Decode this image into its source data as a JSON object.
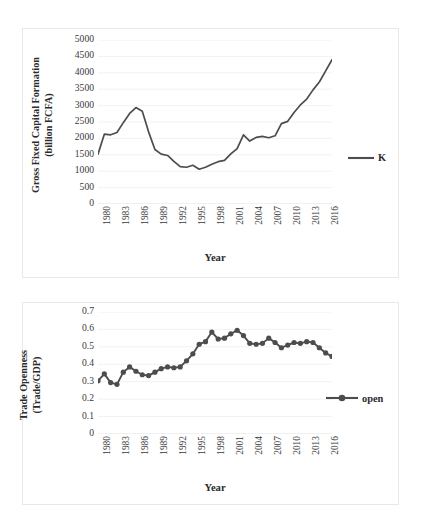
{
  "page": {
    "background": "#ffffff",
    "width": 421,
    "height": 524
  },
  "charts": [
    {
      "id": "chart1",
      "series_color": "#4d4d4d",
      "axis_title_y_line1": "Gross Fixed Capital Formation",
      "axis_title_y_line2": "(billion FCFA)",
      "axis_title_x": "Year",
      "legend_label": "K"
    },
    {
      "id": "chart2",
      "series_color": "#4d4d4d",
      "axis_title_y_line1": "Trade Openness",
      "axis_title_y_line2": "(Trade/GDP)",
      "axis_title_x": "Year",
      "legend_label": "open"
    }
  ],
  "chart_data": [
    {
      "type": "line",
      "title": "",
      "xlabel": "Year",
      "ylabel": "Gross Fixed Capital Formation (billion FCFA)",
      "legend": [
        "K"
      ],
      "legend_position": "right",
      "grid": true,
      "marker": "none",
      "xlim": [
        1980,
        2017
      ],
      "ylim": [
        0,
        5000
      ],
      "ytick_labels": [
        "5000",
        "4500",
        "4000",
        "3500",
        "3000",
        "2500",
        "2000",
        "1500",
        "1000",
        "500",
        "0"
      ],
      "ytick_values": [
        5000,
        4500,
        4000,
        3500,
        3000,
        2500,
        2000,
        1500,
        1000,
        500,
        0
      ],
      "xtick_labels": [
        "1980",
        "1983",
        "1986",
        "1989",
        "1992",
        "1995",
        "1998",
        "2001",
        "2004",
        "2007",
        "2010",
        "2013",
        "2016"
      ],
      "xtick_values": [
        1980,
        1983,
        1986,
        1989,
        1992,
        1995,
        1998,
        2001,
        2004,
        2007,
        2010,
        2013,
        2016
      ],
      "x": [
        1980,
        1981,
        1982,
        1983,
        1984,
        1985,
        1986,
        1987,
        1988,
        1989,
        1990,
        1991,
        1992,
        1993,
        1994,
        1995,
        1996,
        1997,
        1998,
        1999,
        2000,
        2001,
        2002,
        2003,
        2004,
        2005,
        2006,
        2007,
        2008,
        2009,
        2010,
        2011,
        2012,
        2013,
        2014,
        2015,
        2016,
        2017
      ],
      "values": [
        1520,
        2130,
        2110,
        2180,
        2480,
        2760,
        2940,
        2830,
        2200,
        1660,
        1520,
        1480,
        1300,
        1140,
        1120,
        1180,
        1060,
        1120,
        1210,
        1290,
        1330,
        1530,
        1690,
        2110,
        1920,
        2030,
        2060,
        2020,
        2080,
        2450,
        2520,
        2790,
        3020,
        3200,
        3480,
        3720,
        4060,
        4400
      ],
      "series": [
        {
          "name": "K",
          "color": "#4d4d4d",
          "values": [
            1520,
            2130,
            2110,
            2180,
            2480,
            2760,
            2940,
            2830,
            2200,
            1660,
            1520,
            1480,
            1300,
            1140,
            1120,
            1180,
            1060,
            1120,
            1210,
            1290,
            1330,
            1530,
            1690,
            2110,
            1920,
            2030,
            2060,
            2020,
            2080,
            2450,
            2520,
            2790,
            3020,
            3200,
            3480,
            3720,
            4060,
            4400
          ]
        }
      ]
    },
    {
      "type": "line",
      "title": "",
      "xlabel": "Year",
      "ylabel": "Trade Openness (Trade/GDP)",
      "legend": [
        "open"
      ],
      "legend_position": "right",
      "grid": true,
      "marker": "circle",
      "xlim": [
        1980,
        2017
      ],
      "ylim": [
        0,
        0.7
      ],
      "ytick_labels": [
        "0.7",
        "0.6",
        "0.5",
        "0.4",
        "0.3",
        "0.2",
        "0.1",
        "0"
      ],
      "ytick_values": [
        0.7,
        0.6,
        0.5,
        0.4,
        0.3,
        0.2,
        0.1,
        0
      ],
      "xtick_labels": [
        "1980",
        "1983",
        "1986",
        "1989",
        "1992",
        "1995",
        "1998",
        "2001",
        "2004",
        "2007",
        "2010",
        "2013",
        "2016"
      ],
      "xtick_values": [
        1980,
        1983,
        1986,
        1989,
        1992,
        1995,
        1998,
        2001,
        2004,
        2007,
        2010,
        2013,
        2016
      ],
      "x": [
        1980,
        1981,
        1982,
        1983,
        1984,
        1985,
        1986,
        1987,
        1988,
        1989,
        1990,
        1991,
        1992,
        1993,
        1994,
        1995,
        1996,
        1997,
        1998,
        1999,
        2000,
        2001,
        2002,
        2003,
        2004,
        2005,
        2006,
        2007,
        2008,
        2009,
        2010,
        2011,
        2012,
        2013,
        2014,
        2015,
        2016,
        2017
      ],
      "values": [
        0.305,
        0.345,
        0.295,
        0.285,
        0.355,
        0.385,
        0.36,
        0.34,
        0.335,
        0.355,
        0.375,
        0.385,
        0.38,
        0.385,
        0.42,
        0.46,
        0.515,
        0.53,
        0.585,
        0.545,
        0.55,
        0.575,
        0.595,
        0.565,
        0.52,
        0.515,
        0.52,
        0.55,
        0.525,
        0.495,
        0.51,
        0.525,
        0.52,
        0.53,
        0.525,
        0.495,
        0.465,
        0.445
      ],
      "series": [
        {
          "name": "open",
          "color": "#4d4d4d",
          "values": [
            0.305,
            0.345,
            0.295,
            0.285,
            0.355,
            0.385,
            0.36,
            0.34,
            0.335,
            0.355,
            0.375,
            0.385,
            0.38,
            0.385,
            0.42,
            0.46,
            0.515,
            0.53,
            0.585,
            0.545,
            0.55,
            0.575,
            0.595,
            0.565,
            0.52,
            0.515,
            0.52,
            0.55,
            0.525,
            0.495,
            0.51,
            0.525,
            0.52,
            0.53,
            0.525,
            0.495,
            0.465,
            0.445
          ]
        }
      ]
    }
  ]
}
